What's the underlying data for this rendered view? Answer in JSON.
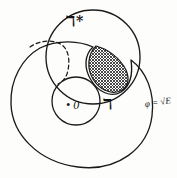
{
  "figure": {
    "kind": "venn-style set diagram",
    "background_color": "#fdfdfc",
    "stroke_color": "#1a1a1a",
    "hatch_color": "#2b2b2b",
    "labels": {
      "upper_circle": "ℸ*",
      "upper_circle_plain": "G*",
      "outer_region": "ℸ",
      "outer_region_plain": "G",
      "inner_circle": "• 0",
      "right_annotation": "φ = √E"
    },
    "shapes": {
      "outer_blob": {
        "name": "large outer closed curve",
        "style": "solid"
      },
      "upper_circle": {
        "name": "upper circle G-star",
        "cx": 93,
        "cy": 57,
        "r": 47,
        "style": "solid"
      },
      "inner_circle": {
        "name": "small inner circle containing origin",
        "cx": 76,
        "cy": 101,
        "r": 24,
        "style": "solid"
      },
      "dashed_arc": {
        "name": "dashed arc inside upper-left",
        "style": "dashed"
      },
      "hatched_lens": {
        "name": "cross-hatched lens intersection region",
        "fill": "cross-hatch"
      }
    }
  }
}
